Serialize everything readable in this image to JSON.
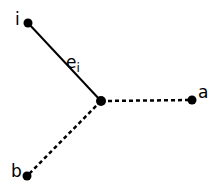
{
  "diagram": {
    "nodes": [
      {
        "id": "i",
        "label": "i"
      },
      {
        "id": "center",
        "label": ""
      },
      {
        "id": "a",
        "label": "a"
      },
      {
        "id": "b",
        "label": "b"
      }
    ],
    "edges": [
      {
        "from": "i",
        "to": "center",
        "style": "solid",
        "label": "e",
        "label_subscript": "i"
      },
      {
        "from": "center",
        "to": "a",
        "style": "dashed"
      },
      {
        "from": "center",
        "to": "b",
        "style": "dashed"
      }
    ],
    "colors": {
      "stroke": "#000000",
      "background": "#ffffff"
    }
  }
}
